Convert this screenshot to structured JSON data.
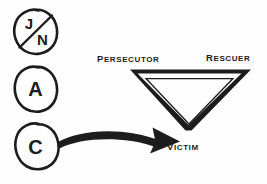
{
  "diagram": {
    "background_color": "#fefefe",
    "ink_color": "#1c1c1c",
    "ego_state_circles": [
      {
        "id": "jn",
        "label_top": "J",
        "label_bottom": "N",
        "crossed_out": true,
        "icon": "circle-jn-crossed-icon"
      },
      {
        "id": "a",
        "label": "A",
        "crossed_out": false,
        "icon": "circle-a-icon"
      },
      {
        "id": "c",
        "label": "C",
        "crossed_out": false,
        "icon": "circle-c-icon"
      }
    ],
    "triangle": {
      "orientation": "point-down",
      "corners": [
        {
          "role": "persecutor",
          "label": "Persecutor",
          "position": "top-left"
        },
        {
          "role": "rescuer",
          "label": "Rescuer",
          "position": "top-right"
        },
        {
          "role": "victim",
          "label": "Victim",
          "position": "bottom"
        }
      ]
    },
    "arrow": {
      "from": "c",
      "to": "victim",
      "style": "curved-tapered",
      "icon": "curved-arrow-icon"
    }
  }
}
